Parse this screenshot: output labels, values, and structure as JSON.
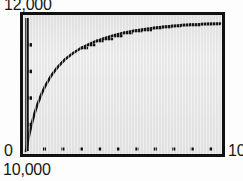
{
  "chart_data": {
    "type": "line",
    "title": "",
    "subtitle": "",
    "xlabel": "",
    "ylabel": "",
    "grid": false,
    "legend": false,
    "legend_position": "none",
    "axis_labels": {
      "y_max": "12,000",
      "y_min": "0",
      "x_min": "10,000",
      "x_max": "10"
    },
    "xlim": [
      0,
      10
    ],
    "ylim": [
      0,
      12000
    ],
    "x_tick_count": 10,
    "y_tick_count": 4,
    "curve_color": "#141414",
    "plot_background": "#e8e8e8",
    "frame_color": "#111111",
    "series": [
      {
        "name": "saturating-curve",
        "x": [
          0.0,
          0.1,
          0.2,
          0.3,
          0.45,
          0.6,
          0.8,
          1.0,
          1.3,
          1.6,
          2.0,
          2.4,
          2.8,
          3.2,
          3.6,
          4.0,
          4.5,
          5.0,
          5.5,
          6.0,
          6.5,
          7.0,
          7.5,
          8.0,
          8.5,
          9.0,
          9.5,
          10.0
        ],
        "y": [
          0,
          900,
          1750,
          2500,
          3450,
          4250,
          5150,
          5900,
          6800,
          7500,
          8250,
          8800,
          9250,
          9600,
          9900,
          10150,
          10420,
          10640,
          10820,
          10960,
          11080,
          11180,
          11270,
          11340,
          11400,
          11440,
          11470,
          11490
        ]
      }
    ]
  }
}
